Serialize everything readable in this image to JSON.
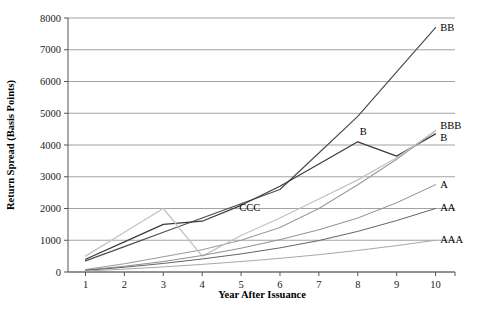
{
  "chart_data": {
    "type": "line",
    "title": "",
    "xlabel": "Year After Issuance",
    "ylabel": "Return Spread (Basis Points)",
    "x": [
      1,
      2,
      3,
      4,
      5,
      6,
      7,
      8,
      9,
      10
    ],
    "xlim": [
      0.55,
      10.5
    ],
    "ylim": [
      0,
      8000
    ],
    "xticks": [
      "1",
      "2",
      "3",
      "4",
      "5",
      "6",
      "7",
      "8",
      "9",
      "10"
    ],
    "yticks": [
      "0",
      "1000",
      "2000",
      "3000",
      "4000",
      "5000",
      "6000",
      "7000",
      "8000"
    ],
    "grid": "horizontal",
    "legend_position": "right-inline-labels",
    "series": [
      {
        "name": "BB",
        "label": "BB",
        "color": "#4d4d4d",
        "width": 1.2,
        "values": [
          350,
          800,
          1250,
          1700,
          2150,
          2600,
          3750,
          4900,
          6300,
          7700
        ],
        "label_x": 10.12,
        "label_y": 7700
      },
      {
        "name": "B",
        "label": "B",
        "color": "#3a3a3a",
        "width": 1.2,
        "values": [
          400,
          950,
          1500,
          1600,
          2100,
          2700,
          3400,
          4100,
          3650,
          4350
        ],
        "label_x": 10.12,
        "label_y": 4230,
        "inner_label": "B",
        "inner_label_x": 8.05,
        "inner_label_y": 4420
      },
      {
        "name": "BBB",
        "label": "BBB",
        "color": "#9a9a9a",
        "width": 1.1,
        "values": [
          80,
          260,
          480,
          700,
          1000,
          1400,
          2000,
          2750,
          3550,
          4450
        ],
        "label_x": 10.12,
        "label_y": 4620
      },
      {
        "name": "CCC",
        "label": "CCC",
        "color": "#c2c2c2",
        "width": 1.3,
        "values": [
          500,
          1250,
          2000,
          500,
          1150,
          1700,
          2300,
          2900,
          3600,
          4450
        ],
        "label_x": 4.95,
        "label_y": 2030,
        "label_anchor": "inline"
      },
      {
        "name": "A",
        "label": "A",
        "color": "#8f8f8f",
        "width": 1.0,
        "values": [
          60,
          180,
          330,
          520,
          750,
          1020,
          1330,
          1700,
          2180,
          2750
        ],
        "label_x": 10.12,
        "label_y": 2760
      },
      {
        "name": "AA",
        "label": "AA",
        "color": "#636363",
        "width": 1.0,
        "values": [
          50,
          150,
          270,
          410,
          570,
          760,
          990,
          1280,
          1620,
          2000
        ],
        "label_x": 10.12,
        "label_y": 2040
      },
      {
        "name": "AAA",
        "label": "AAA",
        "color": "#a8a8a8",
        "width": 1.0,
        "values": [
          30,
          90,
          160,
          240,
          330,
          430,
          545,
          680,
          830,
          1000
        ],
        "label_x": 10.12,
        "label_y": 1040
      }
    ]
  },
  "figure": {
    "background": "#ffffff",
    "axis_color": "#555555",
    "grid_color": "#8c8c8c"
  }
}
